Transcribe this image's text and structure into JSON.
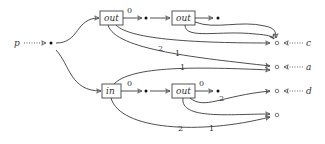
{
  "diagram": {
    "source": {
      "label": "p"
    },
    "boxes": [
      {
        "id": "out1",
        "label": "out"
      },
      {
        "id": "out2",
        "label": "out"
      },
      {
        "id": "in1",
        "label": "in"
      },
      {
        "id": "out3",
        "label": "out"
      }
    ],
    "outputs": [
      {
        "id": "c",
        "label": "c"
      },
      {
        "id": "a",
        "label": "a"
      },
      {
        "id": "d",
        "label": "d"
      },
      {
        "id": "e",
        "label": ""
      }
    ],
    "edge_labels": {
      "out1_0": "0",
      "in1_0": "0",
      "out3_0": "0",
      "out1_to_c": "2",
      "out1_to_a": "1",
      "in1_to_a": "1",
      "out3_to_d": "2",
      "out3_to_e": "1",
      "in1_to_e": "2"
    }
  }
}
